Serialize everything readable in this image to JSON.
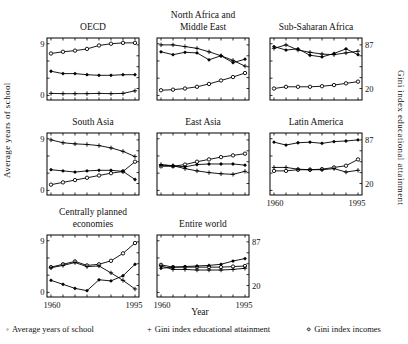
{
  "figure": {
    "left_axis_label": "Average years of school",
    "right_axis_label": "Gini index educational attainment",
    "x_axis_label": "Year",
    "left_tick_labels": [
      "9",
      "0"
    ],
    "right_tick_labels": [
      "87",
      "20"
    ],
    "x_tick_labels": [
      "1960",
      "1995"
    ]
  },
  "legend": {
    "items": [
      {
        "marker": "circle",
        "char": "◦",
        "label": "Average years of school"
      },
      {
        "marker": "plus",
        "char": "+",
        "label": "Gini index educational attainment"
      },
      {
        "marker": "diamond",
        "char": "⋄",
        "label": "Gini index incomes"
      }
    ]
  },
  "chart_data": [
    {
      "id": "oecd",
      "type": "line",
      "title": "OECD",
      "title_lines": [
        "OECD"
      ],
      "x": [
        1960,
        1965,
        1970,
        1975,
        1980,
        1985,
        1990,
        1995
      ],
      "xlim": [
        1960,
        1995
      ],
      "left_ylim": [
        0,
        9
      ],
      "right_ylim": [
        20,
        87
      ],
      "labels": {
        "left": true,
        "right": false,
        "x": false
      },
      "series": [
        {
          "name": "Average years of school",
          "marker": "circle",
          "axis": "left",
          "values": [
            7.3,
            7.6,
            7.8,
            8.1,
            8.7,
            9.0,
            9.15,
            9.15
          ]
        },
        {
          "name": "Gini index educational attainment",
          "marker": "plus",
          "axis": "right",
          "values": [
            12.5,
            12.1,
            12.1,
            12.1,
            12.5,
            12.1,
            12.5,
            16.5
          ]
        },
        {
          "name": "Gini index incomes",
          "marker": "diamond",
          "axis": "right",
          "values": [
            46.5,
            42.9,
            42.9,
            41.2,
            40.3,
            40.3,
            41.2,
            41.2
          ]
        }
      ]
    },
    {
      "id": "name",
      "type": "line",
      "title": "North Africa and Middle East",
      "title_lines": [
        "North Africa and",
        "Middle East"
      ],
      "x": [
        1960,
        1965,
        1970,
        1975,
        1980,
        1985,
        1990,
        1995
      ],
      "xlim": [
        1960,
        1995
      ],
      "left_ylim": [
        0,
        9
      ],
      "right_ylim": [
        20,
        87
      ],
      "labels": {
        "left": false,
        "right": false,
        "x": false
      },
      "series": [
        {
          "name": "Average years of school",
          "marker": "circle",
          "axis": "left",
          "values": [
            0.9,
            1.0,
            1.2,
            1.5,
            2.0,
            2.6,
            3.2,
            3.9
          ]
        },
        {
          "name": "Gini index educational attainment",
          "marker": "plus",
          "axis": "right",
          "values": [
            87.0,
            87.0,
            84.4,
            81.7,
            76.4,
            70.3,
            63.2,
            54.4
          ]
        },
        {
          "name": "Gini index incomes",
          "marker": "diamond",
          "axis": "right",
          "values": [
            76.4,
            72.0,
            75.6,
            74.7,
            64.1,
            70.3,
            59.7,
            65.0
          ]
        }
      ]
    },
    {
      "id": "ssa",
      "type": "line",
      "title": "Sub-Saharan Africa",
      "title_lines": [
        "Sub-Saharan Africa"
      ],
      "x": [
        1960,
        1965,
        1970,
        1975,
        1980,
        1985,
        1990,
        1995
      ],
      "xlim": [
        1960,
        1995
      ],
      "left_ylim": [
        0,
        9
      ],
      "right_ylim": [
        20,
        87
      ],
      "labels": {
        "left": false,
        "right": true,
        "x": false
      },
      "series": [
        {
          "name": "Average years of school",
          "marker": "circle",
          "axis": "left",
          "values": [
            1.2,
            1.5,
            1.5,
            1.5,
            1.6,
            1.8,
            2.1,
            2.4
          ]
        },
        {
          "name": "Gini index educational attainment",
          "marker": "plus",
          "axis": "right",
          "values": [
            81.7,
            87.0,
            79.1,
            75.6,
            72.9,
            72.0,
            74.7,
            77.3
          ]
        },
        {
          "name": "Gini index incomes",
          "marker": "diamond",
          "axis": "right",
          "values": [
            84.4,
            79.1,
            80.9,
            71.1,
            68.5,
            73.8,
            80.9,
            72.0
          ]
        }
      ]
    },
    {
      "id": "south_asia",
      "type": "line",
      "title": "South Asia",
      "title_lines": [
        "South Asia"
      ],
      "x": [
        1960,
        1965,
        1970,
        1975,
        1980,
        1985,
        1990,
        1995
      ],
      "xlim": [
        1960,
        1995
      ],
      "left_ylim": [
        0,
        9
      ],
      "right_ylim": [
        20,
        87
      ],
      "labels": {
        "left": true,
        "right": false,
        "x": false
      },
      "series": [
        {
          "name": "Average years of school",
          "marker": "circle",
          "axis": "left",
          "values": [
            1.0,
            1.4,
            1.8,
            2.2,
            2.6,
            3.0,
            3.3,
            5.0
          ]
        },
        {
          "name": "Gini index educational attainment",
          "marker": "plus",
          "axis": "right",
          "values": [
            87.0,
            82.6,
            80.9,
            80.0,
            78.2,
            74.7,
            69.4,
            61.4
          ]
        },
        {
          "name": "Gini index incomes",
          "marker": "diamond",
          "axis": "right",
          "values": [
            41.2,
            39.4,
            37.6,
            39.4,
            40.3,
            40.3,
            38.7,
            26.2
          ]
        }
      ]
    },
    {
      "id": "east_asia",
      "type": "line",
      "title": "East Asia",
      "title_lines": [
        "East Asia"
      ],
      "x": [
        1960,
        1965,
        1970,
        1975,
        1980,
        1985,
        1990,
        1995
      ],
      "xlim": [
        1960,
        1995
      ],
      "left_ylim": [
        0,
        9
      ],
      "right_ylim": [
        20,
        87
      ],
      "labels": {
        "left": false,
        "right": false,
        "x": false
      },
      "series": [
        {
          "name": "Average years of school",
          "marker": "circle",
          "axis": "left",
          "values": [
            4.2,
            4.2,
            4.5,
            5.0,
            5.4,
            5.8,
            6.1,
            6.4
          ]
        },
        {
          "name": "Gini index educational attainment",
          "marker": "plus",
          "axis": "right",
          "values": [
            49.1,
            47.3,
            42.9,
            39.4,
            36.8,
            35.0,
            34.1,
            38.7
          ]
        },
        {
          "name": "Gini index incomes",
          "marker": "diamond",
          "axis": "right",
          "values": [
            48.2,
            47.3,
            45.6,
            49.1,
            50.0,
            50.0,
            50.0,
            48.2
          ]
        }
      ]
    },
    {
      "id": "latin_america",
      "type": "line",
      "title": "Latin America",
      "title_lines": [
        "Latin America"
      ],
      "x": [
        1960,
        1965,
        1970,
        1975,
        1980,
        1985,
        1990,
        1995
      ],
      "xlim": [
        1960,
        1995
      ],
      "left_ylim": [
        0,
        9
      ],
      "right_ylim": [
        20,
        87
      ],
      "labels": {
        "left": false,
        "right": true,
        "x": true
      },
      "series": [
        {
          "name": "Average years of school",
          "marker": "circle",
          "axis": "left",
          "values": [
            3.4,
            3.4,
            3.6,
            3.6,
            3.7,
            4.0,
            4.3,
            5.4
          ]
        },
        {
          "name": "Gini index educational attainment",
          "marker": "plus",
          "axis": "right",
          "values": [
            44.7,
            44.7,
            42.0,
            41.2,
            41.2,
            42.9,
            37.6,
            40.3
          ]
        },
        {
          "name": "Gini index incomes",
          "marker": "diamond",
          "axis": "right",
          "values": [
            83.5,
            79.1,
            82.6,
            83.5,
            81.7,
            84.4,
            85.3,
            87.0
          ]
        }
      ]
    },
    {
      "id": "centrally_planned",
      "type": "line",
      "title": "Centrally planned economies",
      "title_lines": [
        "Centrally planned",
        "economies"
      ],
      "x": [
        1960,
        1965,
        1970,
        1975,
        1980,
        1985,
        1990,
        1995
      ],
      "xlim": [
        1960,
        1995
      ],
      "left_ylim": [
        0,
        9
      ],
      "right_ylim": [
        20,
        87
      ],
      "labels": {
        "left": true,
        "right": false,
        "x": true
      },
      "series": [
        {
          "name": "Average years of school",
          "marker": "circle",
          "axis": "left",
          "values": [
            4.4,
            4.9,
            5.4,
            4.7,
            4.9,
            5.5,
            6.8,
            8.6
          ]
        },
        {
          "name": "Gini index educational attainment",
          "marker": "plus",
          "axis": "right",
          "values": [
            47.3,
            50.9,
            55.3,
            49.1,
            50.0,
            39.4,
            27.9,
            14.7
          ]
        },
        {
          "name": "Gini index incomes",
          "marker": "diamond",
          "axis": "right",
          "values": [
            27.9,
            21.8,
            15.6,
            12.1,
            28.8,
            27.1,
            35.0,
            52.6
          ]
        }
      ]
    },
    {
      "id": "entire_world",
      "type": "line",
      "title": "Entire world",
      "title_lines": [
        "Entire world"
      ],
      "x": [
        1960,
        1965,
        1970,
        1975,
        1980,
        1985,
        1990,
        1995
      ],
      "xlim": [
        1960,
        1995
      ],
      "left_ylim": [
        0,
        9
      ],
      "right_ylim": [
        20,
        87
      ],
      "labels": {
        "left": false,
        "right": true,
        "x": true
      },
      "series": [
        {
          "name": "Average years of school",
          "marker": "circle",
          "axis": "left",
          "values": [
            4.8,
            4.4,
            4.4,
            4.4,
            4.4,
            4.4,
            4.5,
            4.6
          ]
        },
        {
          "name": "Gini index educational attainment",
          "marker": "plus",
          "axis": "right",
          "values": [
            50.0,
            44.7,
            44.7,
            43.8,
            43.8,
            43.8,
            44.7,
            46.5
          ]
        },
        {
          "name": "Gini index incomes",
          "marker": "diamond",
          "axis": "right",
          "values": [
            46.5,
            48.2,
            49.1,
            50.0,
            50.9,
            52.6,
            57.6,
            61.4
          ]
        }
      ]
    }
  ]
}
